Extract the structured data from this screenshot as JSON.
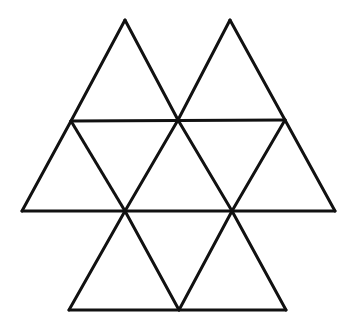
{
  "figure": {
    "stroke_color": "#111111",
    "background_color": "#ffffff",
    "stroke_width": 3,
    "vertices": {
      "A": [
        125,
        20
      ],
      "B": [
        230,
        20
      ],
      "C": [
        71,
        121
      ],
      "D": [
        178,
        120
      ],
      "E": [
        285,
        120
      ],
      "F": [
        22,
        211
      ],
      "G": [
        125,
        211
      ],
      "H": [
        232,
        211
      ],
      "I": [
        335,
        211
      ],
      "J": [
        69,
        310
      ],
      "K": [
        179,
        310
      ],
      "L": [
        286,
        310
      ]
    },
    "segments": [
      [
        "A",
        "C"
      ],
      [
        "A",
        "D"
      ],
      [
        "B",
        "D"
      ],
      [
        "B",
        "E"
      ],
      [
        "C",
        "E"
      ],
      [
        "C",
        "F"
      ],
      [
        "C",
        "G"
      ],
      [
        "D",
        "G"
      ],
      [
        "D",
        "H"
      ],
      [
        "E",
        "H"
      ],
      [
        "E",
        "I"
      ],
      [
        "F",
        "I"
      ],
      [
        "G",
        "J"
      ],
      [
        "G",
        "K"
      ],
      [
        "H",
        "K"
      ],
      [
        "H",
        "L"
      ],
      [
        "J",
        "L"
      ]
    ]
  }
}
